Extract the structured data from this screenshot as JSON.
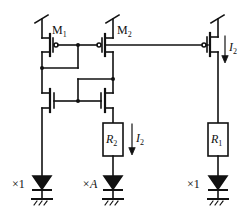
{
  "diagram": {
    "type": "circuit-schematic",
    "colors": {
      "wire": "#111111",
      "background": "#ffffff"
    },
    "transistors": [
      {
        "id": "M1",
        "label": "M",
        "sub": "1",
        "type": "pmos"
      },
      {
        "id": "M2",
        "label": "M",
        "sub": "2",
        "type": "pmos"
      },
      {
        "id": "M3",
        "label": "",
        "type": "pmos"
      },
      {
        "id": "N1",
        "label": "",
        "type": "nmos"
      },
      {
        "id": "N2",
        "label": "",
        "type": "nmos"
      }
    ],
    "resistors": [
      {
        "id": "R2",
        "label": "R",
        "sub": "2"
      },
      {
        "id": "R1",
        "label": "R",
        "sub": "1"
      }
    ],
    "currents": [
      {
        "label": "I",
        "sub": "2",
        "location": "right-branch-top"
      },
      {
        "label": "I",
        "sub": "2",
        "location": "middle-branch-resistor"
      }
    ],
    "diodes": [
      {
        "id": "D1",
        "multiplier": "×1"
      },
      {
        "id": "D2",
        "multiplier": "×A"
      },
      {
        "id": "D3",
        "multiplier": "×1"
      }
    ]
  }
}
